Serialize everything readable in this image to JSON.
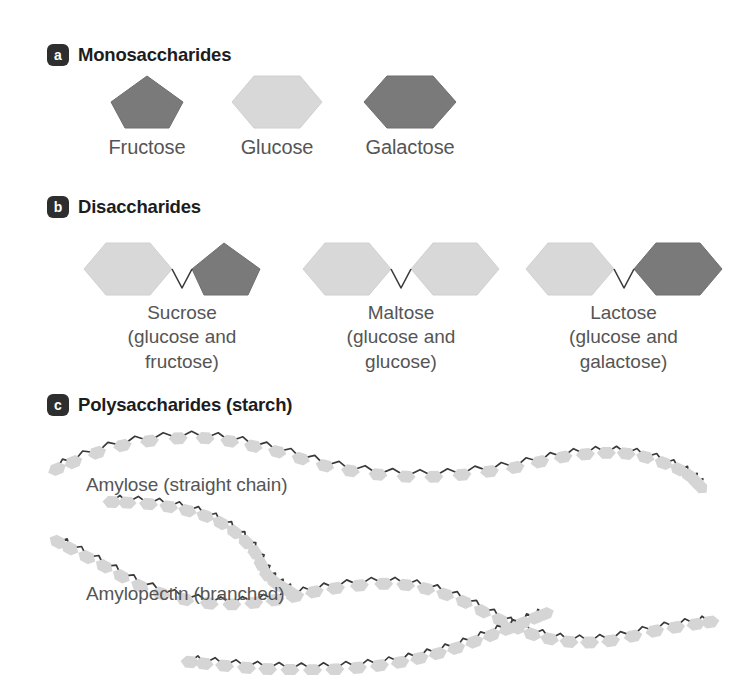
{
  "diagram": {
    "background_color": "#ffffff",
    "text_color": "#555555",
    "badge_color": "#2e2e2e"
  },
  "colors": {
    "light_sugar": "#d8d8d8",
    "light_sugar_stroke": "#d0d0d0",
    "dark_sugar": "#7a7a7a",
    "dark_sugar_stroke": "#6e6e6e",
    "chain_sugar": "#d5d5d5",
    "bond_line": "#3a3a3a"
  },
  "sections": {
    "a": {
      "badge": "a",
      "title": "Monosaccharides",
      "items": [
        {
          "label": "Fructose",
          "shape": "pentagon",
          "tone": "dark"
        },
        {
          "label": "Glucose",
          "shape": "hexagon",
          "tone": "light"
        },
        {
          "label": "Galactose",
          "shape": "hexagon",
          "tone": "dark"
        }
      ]
    },
    "b": {
      "badge": "b",
      "title": "Disaccharides",
      "items": [
        {
          "name": "Sucrose",
          "line1": "Sucrose",
          "line2": "(glucose and",
          "line3": "fructose)",
          "left_shape": "hexagon",
          "left_tone": "light",
          "right_shape": "pentagon",
          "right_tone": "dark"
        },
        {
          "name": "Maltose",
          "line1": "Maltose",
          "line2": "(glucose and",
          "line3": "glucose)",
          "left_shape": "hexagon",
          "left_tone": "light",
          "right_shape": "hexagon",
          "right_tone": "light"
        },
        {
          "name": "Lactose",
          "line1": "Lactose",
          "line2": "(glucose and",
          "line3": "galactose)",
          "left_shape": "hexagon",
          "left_tone": "light",
          "right_shape": "hexagon",
          "right_tone": "dark"
        }
      ]
    },
    "c": {
      "badge": "c",
      "title": "Polysaccharides (starch)",
      "items": [
        {
          "label": "Amylose (straight chain)",
          "structure": "straight"
        },
        {
          "label": "Amylopectin (branched)",
          "structure": "branched"
        }
      ]
    }
  }
}
